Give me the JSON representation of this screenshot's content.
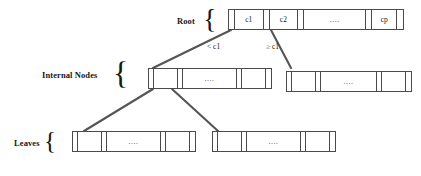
{
  "diagram": {
    "colors": {
      "line": "#4a4a4a",
      "edge": "#555555",
      "text": "#171717",
      "background": "#ffffff"
    },
    "row_labels": [
      {
        "id": "root",
        "label": "Root"
      },
      {
        "id": "internal",
        "label": "Internal Nodes"
      },
      {
        "id": "leaves",
        "label": "Leaves"
      }
    ],
    "braces": {
      "root": "{",
      "internal": "{",
      "leaves": "{"
    },
    "edge_labels": [
      {
        "id": "left-edge",
        "label": "< c1"
      },
      {
        "id": "right-edge",
        "label": "≥ c1"
      }
    ],
    "nodes": {
      "root": {
        "id": "root-node",
        "cells": [
          {
            "type": "pointer",
            "label": ""
          },
          {
            "type": "key",
            "label": "c1"
          },
          {
            "type": "pointer",
            "label": ""
          },
          {
            "type": "key",
            "label": "c2"
          },
          {
            "type": "pointer",
            "label": ""
          },
          {
            "type": "dots",
            "label": "...."
          },
          {
            "type": "pointer",
            "label": ""
          },
          {
            "type": "key",
            "label": "cp"
          },
          {
            "type": "pointer",
            "label": ""
          }
        ]
      },
      "internal_left": {
        "id": "internal-node-left",
        "cells": [
          {
            "type": "pointer",
            "label": ""
          },
          {
            "type": "key",
            "label": ""
          },
          {
            "type": "pointer",
            "label": ""
          },
          {
            "type": "dots",
            "label": "...."
          },
          {
            "type": "pointer",
            "label": ""
          },
          {
            "type": "key",
            "label": ""
          },
          {
            "type": "pointer",
            "label": ""
          }
        ]
      },
      "internal_right": {
        "id": "internal-node-right",
        "cells": [
          {
            "type": "pointer",
            "label": ""
          },
          {
            "type": "key",
            "label": ""
          },
          {
            "type": "pointer",
            "label": ""
          },
          {
            "type": "dots",
            "label": "...."
          },
          {
            "type": "pointer",
            "label": ""
          },
          {
            "type": "key",
            "label": ""
          },
          {
            "type": "pointer",
            "label": ""
          }
        ]
      },
      "leaf_left": {
        "id": "leaf-node-left",
        "cells": [
          {
            "type": "pointer",
            "label": ""
          },
          {
            "type": "key",
            "label": ""
          },
          {
            "type": "pointer",
            "label": ""
          },
          {
            "type": "dots",
            "label": "...."
          },
          {
            "type": "pointer",
            "label": ""
          },
          {
            "type": "key",
            "label": ""
          },
          {
            "type": "pointer",
            "label": ""
          }
        ]
      },
      "leaf_right": {
        "id": "leaf-node-right",
        "cells": [
          {
            "type": "pointer",
            "label": ""
          },
          {
            "type": "key",
            "label": ""
          },
          {
            "type": "pointer",
            "label": ""
          },
          {
            "type": "dots",
            "label": "...."
          },
          {
            "type": "pointer",
            "label": ""
          },
          {
            "type": "key",
            "label": ""
          },
          {
            "type": "pointer",
            "label": ""
          }
        ]
      }
    }
  }
}
